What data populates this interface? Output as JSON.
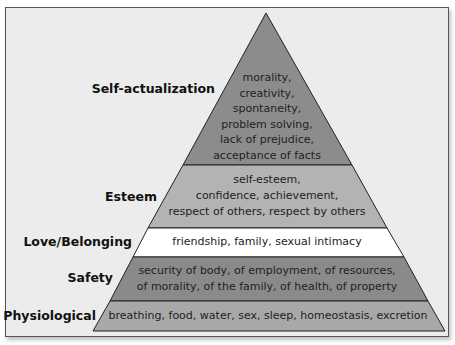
{
  "diagram": {
    "type": "pyramid",
    "colors": {
      "frame_bg": "#ececec",
      "frame_border": "#555555",
      "self_actualization": "#8c8c8c",
      "esteem": "#b3b3b3",
      "love_belonging": "#ffffff",
      "safety": "#8a8a8a",
      "physiological": "#a8a8a8",
      "outline": "#222222"
    },
    "levels": [
      {
        "label": "Self-actualization",
        "lines": [
          "morality,",
          "creativity,",
          "spontaneity,",
          "problem solving,",
          "lack of prejudice,",
          "acceptance of facts"
        ]
      },
      {
        "label": "Esteem",
        "lines": [
          "self-esteem,",
          "confidence, achievement,",
          "respect of others, respect by others"
        ]
      },
      {
        "label": "Love/Belonging",
        "lines": [
          "friendship, family, sexual intimacy"
        ]
      },
      {
        "label": "Safety",
        "lines": [
          "security of body, of employment, of resources,",
          "of morality, of the family, of health, of property"
        ]
      },
      {
        "label": "Physiological",
        "lines": [
          "breathing, food, water, sex, sleep, homeostasis, excretion"
        ]
      }
    ]
  }
}
